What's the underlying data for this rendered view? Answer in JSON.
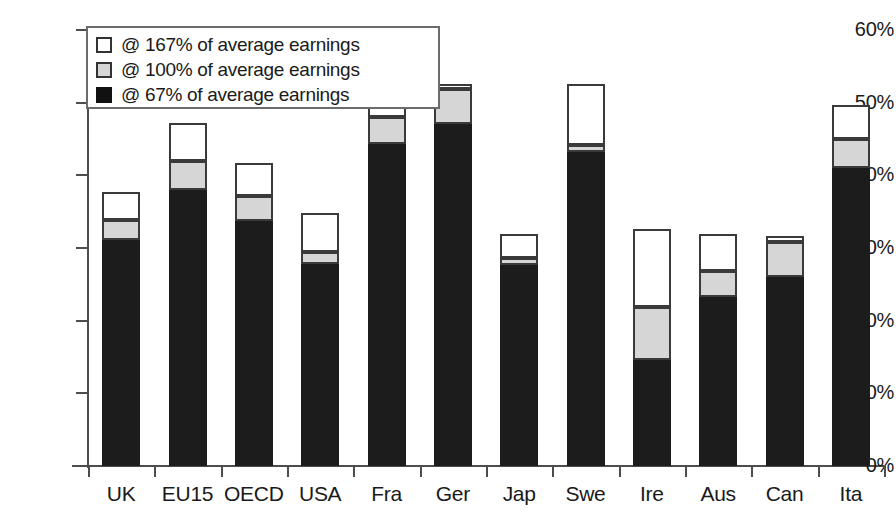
{
  "chart_data": {
    "type": "bar",
    "barmode": "stacked",
    "title": "",
    "subtitle": "",
    "xlabel": "",
    "ylabel": "",
    "ylim": [
      0,
      60
    ],
    "ytick_labels": [
      "0%",
      "10%",
      "20%",
      "30%",
      "40%",
      "50%",
      "60%"
    ],
    "ytick_values": [
      0,
      10,
      20,
      30,
      40,
      50,
      60
    ],
    "grid": false,
    "legend_position": "top-left",
    "categories": [
      "UK",
      "EU15",
      "OECD",
      "USA",
      "Fra",
      "Ger",
      "Jap",
      "Swe",
      "Ire",
      "Aus",
      "Can",
      "Ita"
    ],
    "series": [
      {
        "name": "@ 67% of average earnings",
        "color": "#1c1c1c",
        "values": [
          31.1,
          38.0,
          33.7,
          27.8,
          44.3,
          47.1,
          27.7,
          43.2,
          14.6,
          23.3,
          26.0,
          41.0
        ]
      },
      {
        "name": "@ 100% of average earnings",
        "color": "#d6d6d6",
        "values": [
          2.7,
          4.0,
          3.5,
          1.6,
          3.7,
          4.8,
          0.9,
          1.0,
          7.3,
          3.5,
          4.8,
          4.0
        ]
      },
      {
        "name": "@ 167% of average earnings",
        "color": "#ffffff",
        "values": [
          3.9,
          5.2,
          4.5,
          5.4,
          4.3,
          0.7,
          3.3,
          8.4,
          10.7,
          5.1,
          0.8,
          4.7
        ]
      }
    ],
    "cumulative_tops": {
      "low": [
        31.1,
        38.0,
        33.7,
        27.8,
        44.3,
        47.1,
        27.7,
        43.2,
        14.6,
        23.3,
        26.0,
        41.0
      ],
      "mid": [
        33.8,
        42.0,
        37.2,
        29.4,
        48.0,
        51.9,
        28.6,
        44.2,
        21.9,
        26.8,
        30.8,
        45.0
      ],
      "high": [
        37.7,
        47.2,
        41.7,
        34.8,
        52.3,
        52.6,
        31.9,
        52.6,
        32.6,
        31.9,
        31.6,
        49.7
      ]
    }
  },
  "legend": {
    "items": [
      {
        "label": "@ 167% of average earnings",
        "swatch": "white"
      },
      {
        "label": "@ 100% of average earnings",
        "swatch": "gray"
      },
      {
        "label": "@ 67% of average earnings",
        "swatch": "black"
      }
    ]
  }
}
